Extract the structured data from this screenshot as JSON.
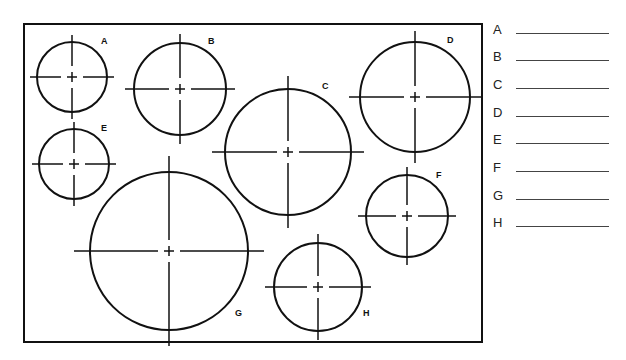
{
  "figure": {
    "frame": {
      "x": 24,
      "y": 24,
      "width": 458,
      "height": 318,
      "stroke": "#111111"
    },
    "circles": [
      {
        "id": "A",
        "label": "A",
        "cx": 72,
        "cy": 77,
        "r": 35,
        "label_x": 101,
        "label_y": 44
      },
      {
        "id": "B",
        "label": "B",
        "cx": 180,
        "cy": 89,
        "r": 46,
        "label_x": 208,
        "label_y": 44
      },
      {
        "id": "C",
        "label": "C",
        "cx": 288,
        "cy": 152,
        "r": 63,
        "label_x": 322,
        "label_y": 89
      },
      {
        "id": "D",
        "label": "D",
        "cx": 415,
        "cy": 97,
        "r": 55,
        "label_x": 447,
        "label_y": 43
      },
      {
        "id": "E",
        "label": "E",
        "cx": 74,
        "cy": 164,
        "r": 35,
        "label_x": 101,
        "label_y": 131
      },
      {
        "id": "F",
        "label": "F",
        "cx": 407,
        "cy": 216,
        "r": 41,
        "label_x": 436,
        "label_y": 178
      },
      {
        "id": "G",
        "label": "G",
        "cx": 169,
        "cy": 251,
        "r": 79,
        "label_x": 235,
        "label_y": 316
      },
      {
        "id": "H",
        "label": "H",
        "cx": 318,
        "cy": 287,
        "r": 44,
        "label_x": 363,
        "label_y": 316
      }
    ]
  },
  "answer_sheet": {
    "rows": [
      {
        "letter": "A",
        "value": ""
      },
      {
        "letter": "B",
        "value": ""
      },
      {
        "letter": "C",
        "value": ""
      },
      {
        "letter": "D",
        "value": ""
      },
      {
        "letter": "E",
        "value": ""
      },
      {
        "letter": "F",
        "value": ""
      },
      {
        "letter": "G",
        "value": ""
      },
      {
        "letter": "H",
        "value": ""
      }
    ]
  }
}
